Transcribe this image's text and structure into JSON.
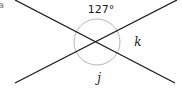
{
  "part_label": "a",
  "angles": {
    "top": "127°",
    "right": "k",
    "bottom": "j"
  },
  "colors": {
    "line": "#1a1a1a",
    "arc": "#b5b5b5",
    "label": "#9a9a9a"
  }
}
